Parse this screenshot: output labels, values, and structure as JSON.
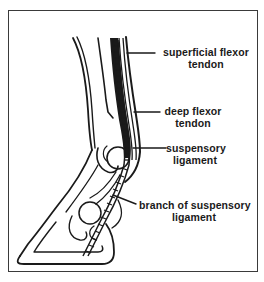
{
  "figure": {
    "labels": [
      {
        "id": "superficial-flexor-tendon",
        "line1": "superficial flexor",
        "line2": "tendon"
      },
      {
        "id": "deep-flexor-tendon",
        "line1": "deep flexor",
        "line2": "tendon"
      },
      {
        "id": "suspensory-ligament",
        "line1": "suspensory",
        "line2": "ligament"
      },
      {
        "id": "branch-of-suspensory-ligament",
        "line1": "branch of suspensory",
        "line2": "ligament"
      }
    ]
  },
  "colors": {
    "ink": "#1a1a1a",
    "frame": "#3a3a3a",
    "background": "#ffffff"
  }
}
